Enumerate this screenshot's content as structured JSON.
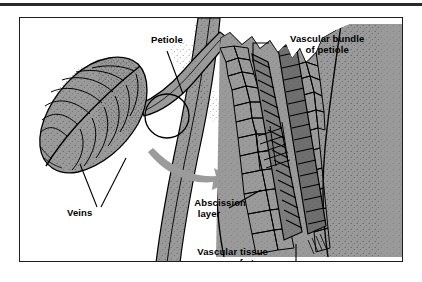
{
  "figure": {
    "type": "botanical-diagram",
    "background_color": "#ffffff",
    "frame_color": "#1d1d1d",
    "tissue_fill": "#9a9a9a",
    "line_color": "#000000",
    "arrow_color": "#9b9b9b"
  },
  "labels": {
    "petiole": "Petiole",
    "vascular_bundle_line1": "Vascular bundle",
    "vascular_bundle_line2": "of petiole",
    "veins": "Veins",
    "abscission_line1": "Abscission",
    "abscission_line2": "layer",
    "vascular_stem_line1": "Vascular tissue",
    "vascular_stem_line2": "of stem"
  },
  "panels": {
    "left": {
      "name": "habit-view",
      "description": "Leaf attached by its petiole to a stem, with a circle marking the abscission zone"
    },
    "right": {
      "name": "magnified-section",
      "description": "Magnified longitudinal section through the petiole base showing cells, abscission layer and vascular strands"
    }
  },
  "callouts": [
    {
      "name": "petiole-callout",
      "target": "petiole stalk"
    },
    {
      "name": "vascular-bundle-callout",
      "target": "vascular bundle in petiole"
    },
    {
      "name": "veins-callout",
      "target": "leaf veins"
    },
    {
      "name": "abscission-callout",
      "target": "abscission layer"
    },
    {
      "name": "vascular-stem-callout",
      "target": "stem vascular tissue"
    }
  ],
  "annotations": {
    "magnifier_circle": "circle marking region enlarged",
    "direction_arrow": "curved arrow pointing to enlargement"
  }
}
